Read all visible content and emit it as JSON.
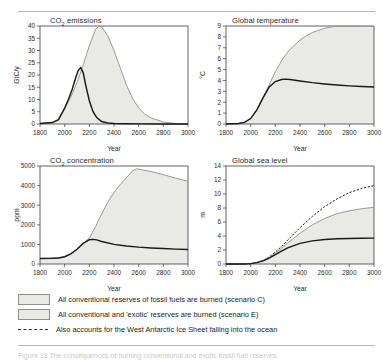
{
  "figure": {
    "caption_clipped": "Figure 18  The consequences of burning conventional and exotic fossil fuel reserves"
  },
  "legend": {
    "items": [
      {
        "swatch": "grey-band-swatch",
        "label": "All conventional reserves of fossil fuels are burned (scenario C)"
      },
      {
        "swatch": "grey-band-swatch",
        "label": "All conventional and 'exotic' reserves are burned (scenario E)"
      },
      {
        "swatch": "dashed-line-swatch",
        "label": "Also accounts for the West Antarctic Ice Sheet falling into the ocean"
      }
    ]
  },
  "chart_data": [
    {
      "type": "area",
      "panel": "co2-emissions",
      "title": "CO2 emissions",
      "title_html": "CO<sub>2</sub> emissions",
      "xlabel": "Year",
      "ylabel": "GtC/y",
      "xlim": [
        1800,
        3000
      ],
      "ylim": [
        0,
        40
      ],
      "xticks": [
        1800,
        2000,
        2200,
        2400,
        2600,
        2800,
        3000
      ],
      "yticks": [
        0,
        5,
        10,
        15,
        20,
        25,
        30,
        35,
        40
      ],
      "grid": false,
      "series": [
        {
          "name": "scenario E",
          "style": "grey",
          "filled": true,
          "x": [
            1800,
            1900,
            1950,
            2000,
            2050,
            2100,
            2150,
            2200,
            2250,
            2280,
            2300,
            2350,
            2400,
            2450,
            2500,
            2550,
            2600,
            2650,
            2700,
            2800,
            2900,
            3000
          ],
          "y": [
            0.2,
            0.6,
            1.8,
            6.5,
            11,
            17,
            24,
            32,
            38.6,
            40,
            39.6,
            36,
            30,
            23,
            16,
            10.5,
            6.5,
            4,
            2.5,
            0.8,
            0.2,
            0.1
          ]
        },
        {
          "name": "scenario C",
          "style": "black",
          "filled": false,
          "x": [
            1800,
            1900,
            1950,
            2000,
            2030,
            2060,
            2090,
            2110,
            2130,
            2150,
            2170,
            2200,
            2230,
            2260,
            2300,
            2350,
            2400,
            2500,
            2600,
            2800,
            3000
          ],
          "y": [
            0.2,
            0.6,
            1.8,
            6.5,
            10,
            14,
            19,
            21.8,
            23,
            21,
            16,
            9.5,
            5,
            2.6,
            1.0,
            0.4,
            0.2,
            0.1,
            0.05,
            0.02,
            0.0
          ]
        }
      ]
    },
    {
      "type": "area",
      "panel": "global-temperature",
      "title": "Global temperature",
      "title_html": "Global temperature",
      "xlabel": "Year",
      "ylabel": "°C",
      "xlim": [
        1800,
        3000
      ],
      "ylim": [
        0,
        9
      ],
      "xticks": [
        1800,
        2000,
        2200,
        2400,
        2600,
        2800,
        3000
      ],
      "yticks": [
        0,
        1,
        2,
        3,
        4,
        5,
        6,
        7,
        8,
        9
      ],
      "grid": false,
      "series": [
        {
          "name": "scenario E",
          "style": "grey",
          "filled": true,
          "x": [
            1800,
            1900,
            1950,
            2000,
            2050,
            2100,
            2150,
            2200,
            2250,
            2300,
            2350,
            2400,
            2450,
            2500,
            2600,
            2700,
            2800,
            2900,
            3000
          ],
          "y": [
            0.0,
            0.05,
            0.15,
            0.5,
            1.3,
            2.4,
            3.6,
            4.8,
            5.8,
            6.6,
            7.2,
            7.7,
            8.1,
            8.4,
            8.8,
            9.0,
            9.0,
            8.98,
            8.95
          ]
        },
        {
          "name": "scenario C",
          "style": "black",
          "filled": false,
          "x": [
            1800,
            1900,
            1950,
            2000,
            2050,
            2100,
            2150,
            2200,
            2250,
            2280,
            2320,
            2400,
            2500,
            2600,
            2700,
            2800,
            2900,
            3000
          ],
          "y": [
            0.0,
            0.05,
            0.15,
            0.5,
            1.3,
            2.4,
            3.4,
            3.9,
            4.08,
            4.12,
            4.08,
            3.95,
            3.8,
            3.68,
            3.58,
            3.5,
            3.44,
            3.4
          ]
        }
      ]
    },
    {
      "type": "area",
      "panel": "co2-concentration",
      "title": "CO2 concentration",
      "title_html": "CO<sub>2</sub> concentration",
      "xlabel": "Year",
      "ylabel": "ppm",
      "xlim": [
        1800,
        3000
      ],
      "ylim": [
        0,
        5000
      ],
      "xticks": [
        1800,
        2000,
        2200,
        2400,
        2600,
        2800,
        3000
      ],
      "yticks": [
        0,
        1000,
        2000,
        3000,
        4000,
        5000
      ],
      "grid": false,
      "series": [
        {
          "name": "scenario E",
          "style": "grey",
          "filled": true,
          "x": [
            1800,
            1900,
            1950,
            2000,
            2050,
            2100,
            2150,
            2200,
            2250,
            2300,
            2350,
            2400,
            2450,
            2500,
            2550,
            2580,
            2600,
            2700,
            2800,
            2900,
            3000
          ],
          "y": [
            280,
            295,
            310,
            370,
            520,
            750,
            1050,
            1320,
            1900,
            2550,
            3150,
            3650,
            4050,
            4400,
            4750,
            4850,
            4840,
            4720,
            4560,
            4380,
            4220
          ]
        },
        {
          "name": "scenario C",
          "style": "black",
          "filled": false,
          "x": [
            1800,
            1900,
            1950,
            2000,
            2050,
            2100,
            2150,
            2200,
            2230,
            2260,
            2300,
            2400,
            2500,
            2600,
            2700,
            2800,
            2900,
            3000
          ],
          "y": [
            280,
            295,
            310,
            370,
            520,
            750,
            1050,
            1240,
            1255,
            1230,
            1150,
            1000,
            920,
            860,
            820,
            790,
            760,
            740
          ]
        }
      ]
    },
    {
      "type": "area",
      "panel": "global-sea-level",
      "title": "Global sea level",
      "title_html": "Global sea level",
      "xlabel": "Year",
      "ylabel": "m",
      "xlim": [
        1800,
        3000
      ],
      "ylim": [
        0,
        14
      ],
      "xticks": [
        1800,
        2000,
        2200,
        2400,
        2600,
        2800,
        3000
      ],
      "yticks": [
        0,
        2,
        4,
        6,
        8,
        10,
        12,
        14
      ],
      "grid": false,
      "series": [
        {
          "name": "West Antarctic Ice Sheet collapse",
          "style": "dashed",
          "filled": false,
          "x": [
            1800,
            1950,
            2000,
            2050,
            2100,
            2150,
            2200,
            2250,
            2300,
            2400,
            2500,
            2600,
            2700,
            2800,
            2900,
            3000
          ],
          "y": [
            0.0,
            0.0,
            0.05,
            0.2,
            0.5,
            1.0,
            1.7,
            2.5,
            3.4,
            5.2,
            6.8,
            8.2,
            9.3,
            10.2,
            10.8,
            11.2
          ]
        },
        {
          "name": "scenario E",
          "style": "grey",
          "filled": true,
          "x": [
            1800,
            1950,
            2000,
            2050,
            2100,
            2150,
            2200,
            2250,
            2300,
            2400,
            2500,
            2600,
            2700,
            2800,
            2900,
            3000
          ],
          "y": [
            0.0,
            0.0,
            0.05,
            0.2,
            0.5,
            0.95,
            1.55,
            2.25,
            3.0,
            4.4,
            5.6,
            6.5,
            7.2,
            7.6,
            7.9,
            8.1
          ]
        },
        {
          "name": "scenario C",
          "style": "black",
          "filled": false,
          "x": [
            1800,
            1950,
            2000,
            2050,
            2100,
            2150,
            2200,
            2250,
            2300,
            2400,
            2500,
            2600,
            2700,
            2800,
            2900,
            3000
          ],
          "y": [
            0.0,
            0.0,
            0.05,
            0.2,
            0.45,
            0.85,
            1.35,
            1.85,
            2.3,
            2.95,
            3.3,
            3.5,
            3.6,
            3.65,
            3.68,
            3.7
          ]
        }
      ]
    }
  ]
}
